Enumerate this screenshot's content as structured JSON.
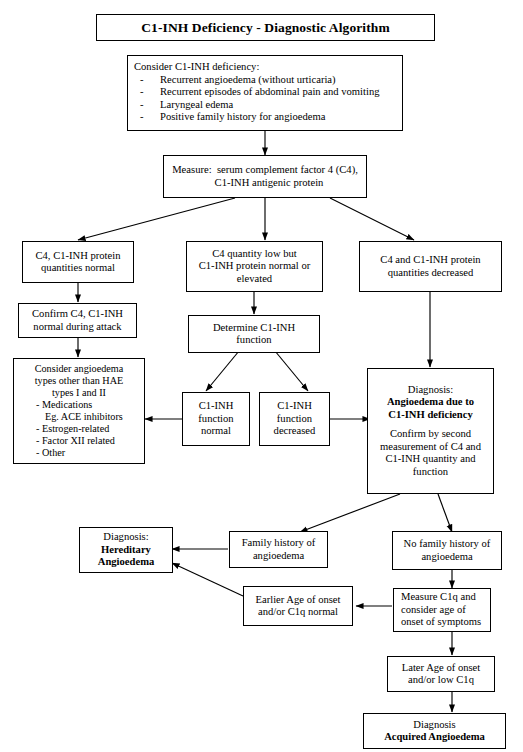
{
  "title": "C1-INH Deficiency - Diagnostic Algorithm",
  "nodes": {
    "consider_deficiency": {
      "heading": "Consider C1-INH deficiency:",
      "dash": "-",
      "items": [
        "Recurrent angioedema (without urticaria)",
        "Recurrent episodes of abdominal pain and vomiting",
        "Laryngeal edema",
        "Positive family history for angioedema"
      ]
    },
    "measure": {
      "line1": "Measure:  serum complement factor 4 (C4),",
      "line2": "C1-INH antigenic protein"
    },
    "c4_normal": {
      "line1": "C4, C1-INH protein",
      "line2": "quantities normal"
    },
    "c4_low": {
      "line1": "C4 quantity low but",
      "line2": "C1-INH protein normal or",
      "line3": "elevated"
    },
    "c4_decreased": {
      "line1": "C4 and C1-INH protein",
      "line2": "quantities decreased"
    },
    "confirm_attack": {
      "line1": "Confirm C4, C1-INH",
      "line2": "normal during attack"
    },
    "determine_function": {
      "line1": "Determine C1-INH",
      "line2": "function"
    },
    "consider_other": {
      "line1": "Consider angioedema",
      "line2": "types other than HAE",
      "line3": "types I and II",
      "items": [
        "- Medications",
        "Eg. ACE inhibitors",
        "- Estrogen-related",
        "- Factor XII related",
        "- Other"
      ]
    },
    "function_normal": {
      "line1": "C1-INH",
      "line2": "function",
      "line3": "normal"
    },
    "function_decreased": {
      "line1": "C1-INH",
      "line2": "function",
      "line3": "decreased"
    },
    "diagnosis_c1inh": {
      "label": "Diagnosis:",
      "bold1": "Angioedema due to",
      "bold2": "C1-INH deficiency",
      "line1": "Confirm by second",
      "line2": "measurement of C4 and",
      "line3": "C1-INH quantity and",
      "line4": "function"
    },
    "family_history": {
      "line1": "Family history of",
      "line2": "angioedema"
    },
    "no_family_history": {
      "line1": "No family history of",
      "line2": "angioedema"
    },
    "diagnosis_hae": {
      "label": "Diagnosis:",
      "bold1": "Hereditary",
      "bold2": "Angioedema"
    },
    "earlier_onset": {
      "line1": "Earlier Age of onset",
      "line2": "and/or C1q normal"
    },
    "measure_c1q": {
      "line1": "Measure C1q and",
      "line2": "consider age of",
      "line3": "onset of symptoms"
    },
    "later_onset": {
      "line1": "Later Age of onset",
      "line2": "and/or low C1q"
    },
    "diagnosis_aae": {
      "label": "Diagnosis",
      "bold1": "Acquired Angioedema"
    }
  },
  "colors": {
    "stroke": "#000000",
    "background": "#ffffff",
    "text": "#000000"
  }
}
